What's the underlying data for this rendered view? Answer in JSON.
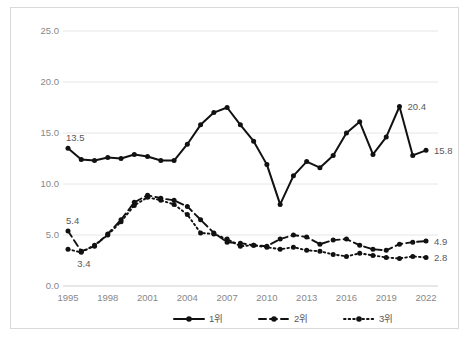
{
  "chart_data": {
    "type": "line",
    "title": "",
    "subtitle": "",
    "xlabel": "",
    "ylabel": "",
    "xlim": [
      1995,
      2022
    ],
    "ylim": [
      0.0,
      25.0
    ],
    "yticks": [
      "0.0",
      "5.0",
      "10.0",
      "15.0",
      "20.0",
      "25.0"
    ],
    "ytick_values": [
      0.0,
      5.0,
      10.0,
      15.0,
      20.0,
      25.0
    ],
    "xticks": [
      "1995",
      "1998",
      "2001",
      "2004",
      "2007",
      "2010",
      "2013",
      "2016",
      "2019",
      "2022"
    ],
    "xtick_values": [
      1995,
      1998,
      2001,
      2004,
      2007,
      2010,
      2013,
      2016,
      2019,
      2022
    ],
    "x": [
      1995,
      1996,
      1997,
      1998,
      1999,
      2000,
      2001,
      2002,
      2003,
      2004,
      2005,
      2006,
      2007,
      2008,
      2009,
      2010,
      2011,
      2012,
      2013,
      2014,
      2015,
      2016,
      2017,
      2018,
      2019,
      2020,
      2021,
      2022
    ],
    "grid": true,
    "grid_axis": "y",
    "legend_position": "bottom",
    "series": [
      {
        "name": "1위",
        "style": "solid",
        "marker": "circle",
        "color": "#111111",
        "values": [
          13.5,
          12.4,
          12.3,
          12.6,
          12.5,
          12.9,
          12.7,
          12.3,
          12.3,
          13.9,
          15.8,
          17.0,
          17.5,
          15.8,
          14.2,
          11.9,
          8.0,
          10.8,
          12.2,
          11.6,
          12.8,
          15.0,
          16.1,
          12.9,
          14.6,
          17.6,
          12.8,
          13.3
        ]
      },
      {
        "name": "2위",
        "style": "dashed",
        "marker": "circle",
        "color": "#111111",
        "values": [
          5.4,
          3.4,
          3.9,
          5.1,
          6.5,
          8.2,
          8.9,
          8.6,
          8.4,
          7.8,
          6.5,
          5.2,
          4.3,
          4.2,
          4.0,
          3.9,
          4.6,
          5.0,
          4.8,
          4.1,
          4.5,
          4.6,
          4.0,
          3.6,
          3.5,
          4.1,
          4.3,
          4.4
        ]
      },
      {
        "name": "3위",
        "style": "dotted",
        "marker": "circle",
        "color": "#111111",
        "values": [
          3.6,
          3.3,
          4.0,
          5.0,
          6.3,
          7.9,
          8.7,
          8.4,
          8.0,
          7.0,
          5.2,
          5.1,
          4.6,
          3.9,
          4.0,
          3.8,
          3.6,
          3.8,
          3.5,
          3.4,
          3.1,
          2.9,
          3.2,
          3.0,
          2.8,
          2.7,
          2.9,
          2.8
        ]
      }
    ],
    "annotations": [
      {
        "label": "13.5",
        "series": "1위",
        "x": 1995,
        "y": 13.5,
        "position": "above-left"
      },
      {
        "label": "20.4",
        "series": "1위",
        "x": 2020,
        "y": 17.6,
        "position": "right"
      },
      {
        "label": "15.8",
        "series": "1위",
        "x": 2022,
        "y": 13.3,
        "position": "right"
      },
      {
        "label": "5.4",
        "series": "2위",
        "x": 1995,
        "y": 5.4,
        "position": "above-left"
      },
      {
        "label": "3.4",
        "series": "2위",
        "x": 1996,
        "y": 3.4,
        "position": "below"
      },
      {
        "label": "4.9",
        "series": "2위",
        "x": 2022,
        "y": 4.4,
        "position": "right"
      },
      {
        "label": "2.8",
        "series": "3위",
        "x": 2022,
        "y": 2.8,
        "position": "right"
      }
    ],
    "legend": [
      {
        "label": "1위",
        "style": "solid"
      },
      {
        "label": "2위",
        "style": "dashed"
      },
      {
        "label": "3위",
        "style": "dotted"
      }
    ]
  }
}
